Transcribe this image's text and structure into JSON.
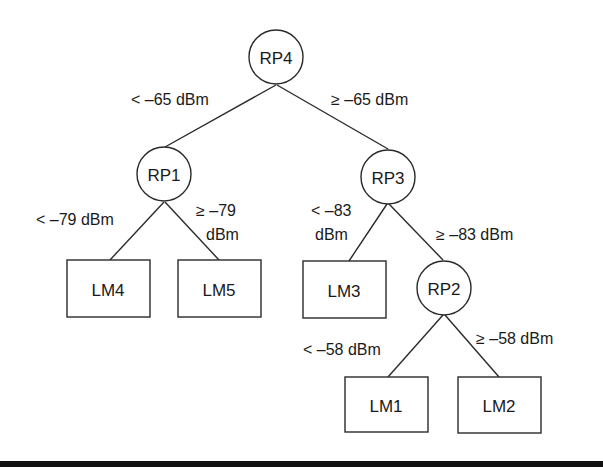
{
  "diagram": {
    "type": "decision-tree",
    "nodes": {
      "rp4": {
        "label": "RP4",
        "shape": "circle",
        "cx": 276,
        "cy": 57,
        "r": 27
      },
      "rp1": {
        "label": "RP1",
        "shape": "circle",
        "cx": 163,
        "cy": 174,
        "r": 27
      },
      "rp3": {
        "label": "RP3",
        "shape": "circle",
        "cx": 387,
        "cy": 176,
        "r": 27
      },
      "rp2": {
        "label": "RP2",
        "shape": "circle",
        "cx": 444,
        "cy": 287,
        "r": 27
      },
      "lm4": {
        "label": "LM4",
        "shape": "box",
        "x": 67,
        "y": 260,
        "w": 83,
        "h": 57
      },
      "lm5": {
        "label": "LM5",
        "shape": "box",
        "x": 178,
        "y": 260,
        "w": 83,
        "h": 57
      },
      "lm3": {
        "label": "LM3",
        "shape": "box",
        "x": 303,
        "y": 261,
        "w": 83,
        "h": 57
      },
      "lm1": {
        "label": "LM1",
        "shape": "box",
        "x": 345,
        "y": 377,
        "w": 83,
        "h": 55
      },
      "lm2": {
        "label": "LM2",
        "shape": "box",
        "x": 458,
        "y": 377,
        "w": 83,
        "h": 56
      }
    },
    "edges": [
      {
        "from": "RP4",
        "to": "RP1",
        "label_lines": [
          "< –65 dBm"
        ]
      },
      {
        "from": "RP4",
        "to": "RP3",
        "label_lines": [
          "≥ –65 dBm"
        ]
      },
      {
        "from": "RP1",
        "to": "LM4",
        "label_lines": [
          "< –79 dBm"
        ]
      },
      {
        "from": "RP1",
        "to": "LM5",
        "label_lines": [
          "≥  –79",
          "dBm"
        ]
      },
      {
        "from": "RP3",
        "to": "LM3",
        "label_lines": [
          "< –83",
          "dBm"
        ]
      },
      {
        "from": "RP3",
        "to": "RP2",
        "label_lines": [
          "≥  –83 dBm"
        ]
      },
      {
        "from": "RP2",
        "to": "LM1",
        "label_lines": [
          "< –58 dBm"
        ]
      },
      {
        "from": "RP2",
        "to": "LM2",
        "label_lines": [
          "≥ –58 dBm"
        ]
      }
    ],
    "colors": {
      "stroke": "#2a2a2a",
      "text": "#1a1a1a",
      "background": "#ffffff",
      "bottom_bar": "#111111"
    }
  }
}
